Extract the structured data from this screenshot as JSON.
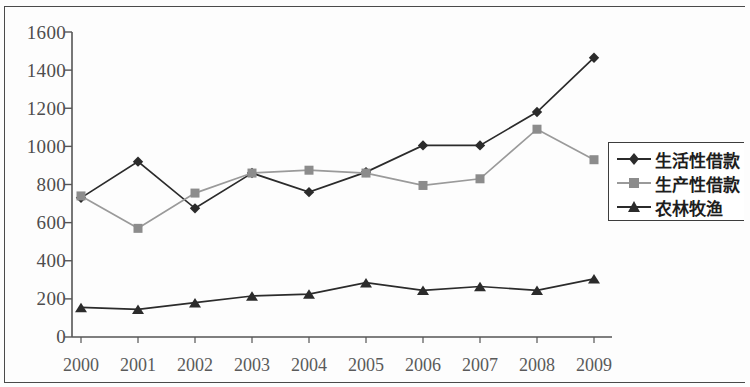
{
  "chart_data": {
    "type": "line",
    "title": "",
    "subtitle": "",
    "xlabel": "",
    "ylabel": "",
    "categories": [
      "2000",
      "2001",
      "2002",
      "2003",
      "2004",
      "2005",
      "2006",
      "2007",
      "2008",
      "2009"
    ],
    "ylim": [
      0,
      1600
    ],
    "yticks": [
      0,
      200,
      400,
      600,
      800,
      1000,
      1200,
      1400,
      1600
    ],
    "ytick_labels": [
      "0",
      "200",
      "400",
      "600",
      "800",
      "1000",
      "1200",
      "1400",
      "1600"
    ],
    "grid": false,
    "legend_position": "right",
    "series": [
      {
        "name": "生活性借款",
        "marker": "diamond",
        "color": "#2b2b2b",
        "values": [
          730,
          920,
          675,
          860,
          760,
          865,
          1005,
          1005,
          1180,
          1465
        ]
      },
      {
        "name": "生产性借款",
        "marker": "square",
        "color": "#8c8c8c",
        "values": [
          740,
          570,
          755,
          860,
          875,
          860,
          795,
          830,
          1090,
          930
        ]
      },
      {
        "name": "农林牧渔",
        "marker": "triangle",
        "color": "#2b2b2b",
        "values": [
          155,
          145,
          180,
          215,
          225,
          285,
          245,
          265,
          245,
          305
        ]
      }
    ]
  },
  "legend": {
    "items": [
      {
        "label": "生活性借款",
        "marker": "diamond-marker-icon"
      },
      {
        "label": "生产性借款",
        "marker": "square-marker-icon"
      },
      {
        "label": "农林牧渔",
        "marker": "triangle-marker-icon"
      }
    ]
  },
  "axes": {
    "y_tick_labels": [
      "1600",
      "1400",
      "1200",
      "1000",
      "800",
      "600",
      "400",
      "200",
      "0"
    ],
    "x_tick_labels": [
      "2000",
      "2001",
      "2002",
      "2003",
      "2004",
      "2005",
      "2006",
      "2007",
      "2008",
      "2009"
    ]
  },
  "colors": {
    "series_dark": "#2b2b2b",
    "series_gray": "#8c8c8c",
    "axis": "#555555",
    "border": "#4a4a4a",
    "background": "#fdfdfd"
  }
}
